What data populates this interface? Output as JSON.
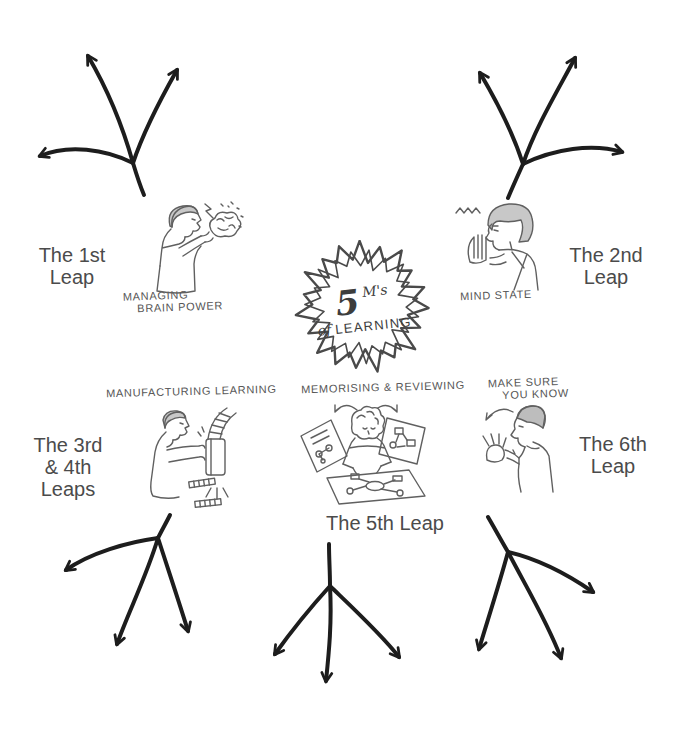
{
  "diagram": {
    "name": "5 M's of Learning mind-map",
    "center_badge": {
      "number": "5",
      "m_label": "M's",
      "of": "of",
      "learning": "LEARNING"
    }
  },
  "leaps": [
    {
      "id": "leap-1",
      "label_lines": [
        "The 1st",
        "Leap"
      ]
    },
    {
      "id": "leap-2",
      "label_lines": [
        "The 2nd",
        "Leap"
      ]
    },
    {
      "id": "leap-3-4",
      "label_lines": [
        "The 3rd",
        "& 4th",
        "Leaps"
      ]
    },
    {
      "id": "leap-5",
      "label_lines": [
        "The 5th Leap"
      ]
    },
    {
      "id": "leap-6",
      "label_lines": [
        "The 6th",
        "Leap"
      ]
    }
  ],
  "sketches": [
    {
      "name": "managing-brain-power",
      "caption_line1": "MANAGING",
      "caption_line2": "BRAIN POWER"
    },
    {
      "name": "mind-state",
      "caption_line1": "MIND STATE",
      "caption_line2": ""
    },
    {
      "name": "manufacturing-learning",
      "caption_line1": "MANUFACTURING  LEARNING",
      "caption_line2": ""
    },
    {
      "name": "memorising-reviewing",
      "caption_line1": "MEMORISING & REVIEWING",
      "caption_line2": ""
    },
    {
      "name": "make-sure-you-know",
      "caption_line1": "MAKE SURE",
      "caption_line2": "YOU KNOW"
    }
  ],
  "branch_glyphs": [
    {
      "name": "three-branch-arrow-top-left"
    },
    {
      "name": "three-branch-arrow-top-right"
    },
    {
      "name": "three-branch-arrow-bottom-left"
    },
    {
      "name": "three-branch-arrow-bottom-center"
    },
    {
      "name": "three-branch-arrow-bottom-right"
    }
  ],
  "colors": {
    "ink": "#1d1d1d",
    "label_text": "#4b4b4b",
    "sketch_stroke": "#606060",
    "hair_fill": "#c8c8c8",
    "star_outline": "#4a4a4a",
    "background": "#ffffff"
  }
}
